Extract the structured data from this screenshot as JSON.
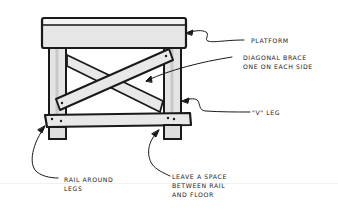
{
  "diagram": {
    "colors": {
      "ink": "#1a1a1a",
      "wood_fill": "#e6e6e6",
      "wood_shade": "#d2d2d2",
      "background": "#ffffff"
    },
    "labels": {
      "platform": "PLATFORM",
      "diagonal_brace_line1": "DIAGONAL BRACE",
      "diagonal_brace_line2": "ONE ON EACH SIDE",
      "v_leg": "\"V\" LEG",
      "rail_line1": "RAIL AROUND",
      "rail_line2": "LEGS",
      "space_line1": "LEAVE A SPACE",
      "space_line2": "BETWEEN RAIL",
      "space_line3": "AND FLOOR"
    }
  }
}
